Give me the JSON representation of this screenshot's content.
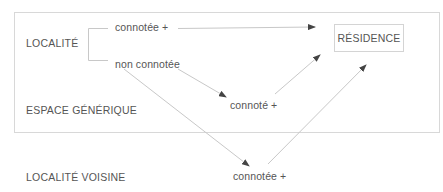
{
  "diagram": {
    "type": "flow-diagram",
    "nodes": {
      "localite": "LOCALITÉ",
      "branch_connotee": "connotée +",
      "branch_non_connotee": "non connotée",
      "residence": "RÉSIDENCE",
      "espace_generique": "ESPACE GÉNÉRIQUE",
      "espace_connote": "connoté +",
      "localite_voisine": "LOCALITÉ VOISINE",
      "voisine_connotee": "connotée +"
    },
    "edges": [
      {
        "from": "connotée +",
        "to": "RÉSIDENCE"
      },
      {
        "from": "non connotée",
        "to": "connoté +"
      },
      {
        "from": "non connotée",
        "to": "connotée + (LOCALITÉ VOISINE)"
      },
      {
        "from": "connoté +",
        "to": "RÉSIDENCE"
      },
      {
        "from": "connotée + (LOCALITÉ VOISINE)",
        "to": "RÉSIDENCE"
      }
    ],
    "colors": {
      "text": "#555555",
      "line": "#c8c8c8",
      "box_border": "#d8d8d8",
      "arrow": "#444444"
    }
  }
}
